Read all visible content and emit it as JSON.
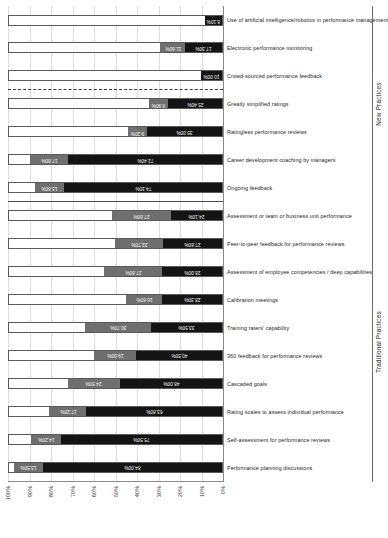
{
  "chart_data": {
    "type": "bar",
    "title": "",
    "subtitle": "",
    "xlabel": "",
    "ylabel": "",
    "ylim": [
      0,
      100
    ],
    "grid": true,
    "stacked": true,
    "orientation": "vertical-rotated",
    "legend_position": "none",
    "axis_ticks": [
      "0%",
      "10%",
      "20%",
      "30%",
      "40%",
      "50%",
      "60%",
      "70%",
      "80%",
      "90%",
      "100%"
    ],
    "categories": [
      "Performance planning discussions",
      "Self-assessment for performance reviews",
      "Rating scales to assess individual performance",
      "Cascaded goals",
      "360 feedback for performance reviews",
      "Training raters' capability",
      "Calibration meetings",
      "Assessment of employee competencies / deep capabilities",
      "Peer-to-peer feedback for performance reviews",
      "Assessment or team or business unit performance",
      "Ongoing feedback",
      "Career development coaching by managers",
      "Ratingless performance reviews",
      "Greatly simplified ratings",
      "Crowd-sourced performance feedback",
      "Electronic performance monitoring",
      "Use of artificial intelligence/robotics in performance management"
    ],
    "series": [
      {
        "name": "Segment 1",
        "color": "#141414",
        "values": [
          84.0,
          75.5,
          63.8,
          48.0,
          40.5,
          33.5,
          28.3,
          28.0,
          27.6,
          24.1,
          74.3,
          72.4,
          35.0,
          25.4,
          10.0,
          17.3,
          8.1
        ]
      },
      {
        "name": "Segment 2",
        "color": "#6f6f6f",
        "values": [
          13.5,
          14.2,
          17.2,
          24.5,
          19.6,
          30.7,
          16.6,
          27.6,
          22.7,
          27.6,
          13.6,
          17.8,
          9.2,
          8.9,
          0,
          11.6,
          0
        ]
      }
    ],
    "data_labels": [
      {
        "category": "Performance planning discussions",
        "s1": "84.00%",
        "s2": "13.50%"
      },
      {
        "category": "Self-assessment for performance reviews",
        "s1": "75.50%",
        "s2": "14.20%"
      },
      {
        "category": "Rating scales to assess individual performance",
        "s1": "63.80%",
        "s2": "17.20%"
      },
      {
        "category": "Cascaded goals",
        "s1": "48.00%",
        "s2": "24.50%"
      },
      {
        "category": "360 feedback for performance reviews",
        "s1": "40.50%",
        "s2": "19.60%"
      },
      {
        "category": "Training raters' capability",
        "s1": "33.50%",
        "s2": "30.70%"
      },
      {
        "category": "Calibration meetings",
        "s1": "28.30%",
        "s2": "16.60%"
      },
      {
        "category": "Assessment of employee competencies / deep capabilities",
        "s1": "28.00%",
        "s2": "27.60%"
      },
      {
        "category": "Peer-to-peer feedback for performance reviews",
        "s1": "27.60%",
        "s2": "22.70%"
      },
      {
        "category": "Assessment or team or business unit performance",
        "s1": "24.10%",
        "s2": "27.60%"
      },
      {
        "category": "Ongoing feedback",
        "s1": "74.30%",
        "s2": "13.60%"
      },
      {
        "category": "Career development coaching by managers",
        "s1": "72.40%",
        "s2": "17.80%"
      },
      {
        "category": "Ratingless performance reviews",
        "s1": "35.00%",
        "s2": "9.20%"
      },
      {
        "category": "Greatly simplified ratings",
        "s1": "25.40%",
        "s2": "8.90%"
      },
      {
        "category": "Crowd-sourced performance feedback",
        "s1": "10.00%",
        "s2": ""
      },
      {
        "category": "Electronic performance monitoring",
        "s1": "17.30%",
        "s2": "11.60%"
      },
      {
        "category": "Use of artificial intelligence/robotics in performance management",
        "s1": "8.10%",
        "s2": ""
      }
    ],
    "groups": [
      {
        "label": "Traditional Practices",
        "start": 0,
        "end": 9
      },
      {
        "label": "New Practices",
        "start": 10,
        "end": 16
      }
    ],
    "separators": [
      {
        "after_index": 9,
        "style": "solid"
      },
      {
        "after_index": 13,
        "style": "dashed"
      }
    ]
  }
}
